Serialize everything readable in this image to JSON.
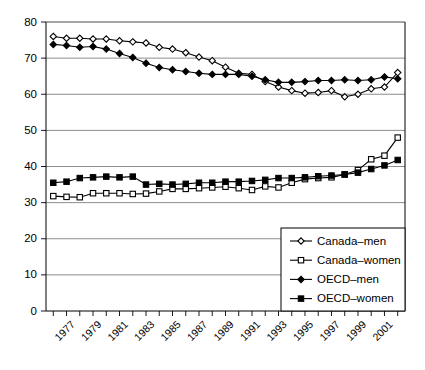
{
  "chart_data": {
    "type": "line",
    "title": "",
    "subtitle": "",
    "xlabel": "",
    "ylabel": "",
    "ylim": [
      0,
      80
    ],
    "ytick_values": [
      0,
      10,
      20,
      30,
      40,
      50,
      60,
      70,
      80
    ],
    "ytick_labels": [
      "0",
      "10",
      "20",
      "30",
      "40",
      "50",
      "60",
      "70",
      "80"
    ],
    "grid": "horizontal",
    "legend_position": "bottom-right",
    "x": [
      1976,
      1977,
      1978,
      1979,
      1980,
      1981,
      1982,
      1983,
      1984,
      1985,
      1986,
      1987,
      1988,
      1989,
      1990,
      1991,
      1992,
      1993,
      1994,
      1995,
      1996,
      1997,
      1998,
      1999,
      2000,
      2001,
      2002
    ],
    "xtick_labels": [
      "",
      "1977",
      "",
      "1979",
      "",
      "1981",
      "",
      "1983",
      "",
      "1985",
      "",
      "1987",
      "",
      "1989",
      "",
      "1991",
      "",
      "1993",
      "",
      "1995",
      "",
      "1997",
      "",
      "1999",
      "",
      "2001",
      ""
    ],
    "series": [
      {
        "name": "Canada–men",
        "marker": "open-diamond",
        "values": [
          76.0,
          75.5,
          75.5,
          75.3,
          75.3,
          74.8,
          74.5,
          74.2,
          73.0,
          72.5,
          71.5,
          70.3,
          69.3,
          67.5,
          65.8,
          65.5,
          63.5,
          62.0,
          61.0,
          60.3,
          60.5,
          61.0,
          59.3,
          60.0,
          61.5,
          62.0,
          66.0
        ]
      },
      {
        "name": "Canada–women",
        "marker": "open-square",
        "values": [
          31.8,
          31.6,
          31.5,
          32.6,
          32.6,
          32.6,
          32.4,
          32.5,
          33.1,
          33.8,
          33.8,
          34.0,
          34.2,
          34.4,
          34.0,
          33.5,
          34.5,
          34.2,
          35.5,
          36.5,
          36.8,
          37.0,
          37.8,
          39.0,
          42.0,
          43.0,
          48.0
        ]
      },
      {
        "name": "OECD–men",
        "marker": "filled-diamond",
        "values": [
          73.8,
          73.5,
          73.0,
          73.2,
          72.5,
          71.3,
          70.2,
          68.6,
          67.4,
          66.8,
          66.3,
          65.8,
          65.5,
          65.5,
          65.5,
          65.0,
          64.0,
          63.3,
          63.3,
          63.5,
          63.8,
          63.8,
          64.0,
          63.8,
          64.0,
          64.8,
          64.3
        ]
      },
      {
        "name": "OECD–women",
        "marker": "filled-square",
        "values": [
          35.5,
          35.8,
          36.8,
          37.0,
          37.2,
          37.0,
          37.2,
          35.0,
          35.2,
          35.0,
          35.2,
          35.5,
          35.5,
          35.8,
          35.8,
          36.0,
          36.3,
          36.8,
          36.8,
          37.0,
          37.3,
          37.5,
          37.8,
          38.3,
          39.3,
          40.3,
          41.8
        ]
      }
    ]
  },
  "legend": {
    "items": [
      {
        "label": "Canada–men",
        "marker": "open-diamond"
      },
      {
        "label": "Canada–women",
        "marker": "open-square"
      },
      {
        "label": "OECD–men",
        "marker": "filled-diamond"
      },
      {
        "label": "OECD–women",
        "marker": "filled-square"
      }
    ]
  },
  "colors": {
    "line": "#000000",
    "grid": "#808080",
    "axis": "#000000",
    "background": "#ffffff",
    "marker_fill_open": "#ffffff",
    "marker_fill_solid": "#000000"
  }
}
